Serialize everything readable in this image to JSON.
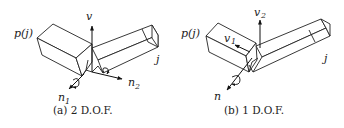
{
  "figure": {
    "panels": [
      {
        "id": "a",
        "caption": "(a) 2 D.O.F.",
        "labels": {
          "parent": "p(j)",
          "child": "j",
          "v": "v",
          "n1": "n",
          "n1_sub": "1",
          "n2": "n",
          "n2_sub": "2"
        }
      },
      {
        "id": "b",
        "caption": "(b) 1 D.O.F.",
        "labels": {
          "parent": "p(j)",
          "child": "j",
          "v1": "v",
          "v1_sub": "1",
          "v2": "v",
          "v2_sub": "2",
          "n": "n"
        }
      }
    ]
  }
}
